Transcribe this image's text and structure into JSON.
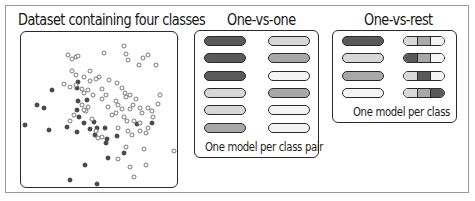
{
  "panels": {
    "dataset": {
      "title": "Dataset containing four classes"
    },
    "one_vs_one": {
      "title": "One-vs-one",
      "caption": "One model per class pair",
      "rows": [
        {
          "left": "#5a5a5a",
          "right": "#d8d8d8"
        },
        {
          "left": "#5a5a5a",
          "right": "#a8a8a8"
        },
        {
          "left": "#5a5a5a",
          "right": "#f4f4f4"
        },
        {
          "left": "#d8d8d8",
          "right": "#a8a8a8"
        },
        {
          "left": "#d8d8d8",
          "right": "#f4f4f4"
        },
        {
          "left": "#a8a8a8",
          "right": "#f4f4f4"
        }
      ]
    },
    "one_vs_rest": {
      "title": "One-vs-rest",
      "caption": "One model per class",
      "rows": [
        {
          "single": "#5a5a5a",
          "rest": [
            "#d8d8d8",
            "#a8a8a8",
            "#f4f4f4"
          ]
        },
        {
          "single": "#d8d8d8",
          "rest": [
            "#5a5a5a",
            "#a8a8a8",
            "#f4f4f4"
          ]
        },
        {
          "single": "#a8a8a8",
          "rest": [
            "#d8d8d8",
            "#5a5a5a",
            "#f4f4f4"
          ]
        },
        {
          "single": "#f4f4f4",
          "rest": [
            "#d8d8d8",
            "#a8a8a8",
            "#5a5a5a"
          ]
        }
      ]
    }
  },
  "colors": {
    "class_dark": "#5a5a5a",
    "class_light": "#d8d8d8",
    "class_mid": "#a8a8a8",
    "class_white": "#f4f4f4",
    "outline": "#2a2a2a"
  },
  "chart_data": {
    "type": "scatter",
    "title": "Dataset containing four classes",
    "xlabel": "",
    "ylabel": "",
    "grid": false,
    "legend": "none",
    "xlim": [
      0,
      158
    ],
    "ylim": [
      0,
      157
    ],
    "series": [
      {
        "name": "filled (dark)",
        "marker": "filled-circle",
        "points": [
          [
            30,
            55
          ],
          [
            15,
            70
          ],
          [
            22,
            73
          ],
          [
            3,
            90
          ],
          [
            45,
            92
          ],
          [
            27,
            95
          ],
          [
            55,
            53
          ],
          [
            56,
            66
          ],
          [
            55,
            75
          ],
          [
            57,
            82
          ],
          [
            62,
            88
          ],
          [
            55,
            97
          ],
          [
            68,
            94
          ],
          [
            75,
            93
          ],
          [
            83,
            93
          ],
          [
            73,
            100
          ],
          [
            84,
            108
          ],
          [
            85,
            104
          ],
          [
            95,
            101
          ],
          [
            115,
            89
          ],
          [
            102,
            118
          ],
          [
            86,
            123
          ],
          [
            63,
            130
          ],
          [
            48,
            145
          ],
          [
            75,
            149
          ],
          [
            130,
            88
          ],
          [
            56,
            47
          ],
          [
            65,
            65
          ],
          [
            72,
            87
          ]
        ]
      },
      {
        "name": "hollow (light)",
        "marker": "hollow-circle",
        "points": [
          [
            46,
            20
          ],
          [
            50,
            24
          ],
          [
            54,
            22
          ],
          [
            56,
            21
          ],
          [
            82,
            18
          ],
          [
            102,
            11
          ],
          [
            104,
            19
          ],
          [
            106,
            25
          ],
          [
            121,
            23
          ],
          [
            126,
            20
          ],
          [
            117,
            30
          ],
          [
            134,
            30
          ],
          [
            159,
            4
          ],
          [
            50,
            36
          ],
          [
            54,
            40
          ],
          [
            62,
            42
          ],
          [
            68,
            46
          ],
          [
            77,
            42
          ],
          [
            87,
            45
          ],
          [
            95,
            48
          ],
          [
            42,
            49
          ],
          [
            48,
            52
          ],
          [
            54,
            50
          ],
          [
            60,
            54
          ],
          [
            62,
            58
          ],
          [
            66,
            55
          ],
          [
            80,
            54
          ],
          [
            84,
            60
          ],
          [
            100,
            53
          ],
          [
            103,
            58
          ],
          [
            104,
            62
          ],
          [
            108,
            60
          ],
          [
            138,
            60
          ],
          [
            136,
            69
          ],
          [
            114,
            64
          ],
          [
            111,
            70
          ],
          [
            96,
            70
          ],
          [
            94,
            78
          ],
          [
            100,
            74
          ],
          [
            102,
            82
          ],
          [
            105,
            86
          ],
          [
            108,
            74
          ],
          [
            118,
            73
          ],
          [
            126,
            73
          ],
          [
            130,
            76
          ],
          [
            131,
            82
          ],
          [
            120,
            78
          ],
          [
            112,
            86
          ],
          [
            118,
            88
          ],
          [
            106,
            96
          ],
          [
            110,
            100
          ],
          [
            118,
            96
          ],
          [
            126,
            93
          ],
          [
            124,
            98
          ],
          [
            64,
            76
          ],
          [
            66,
            72
          ],
          [
            70,
            84
          ],
          [
            74,
            96
          ],
          [
            76,
            103
          ],
          [
            80,
            102
          ],
          [
            71,
            60
          ],
          [
            94,
            66
          ],
          [
            60,
            70
          ],
          [
            62,
            75
          ],
          [
            52,
            80
          ],
          [
            48,
            86
          ],
          [
            96,
            93
          ],
          [
            104,
            112
          ],
          [
            122,
            114
          ],
          [
            96,
            124
          ],
          [
            124,
            130
          ],
          [
            152,
            116
          ],
          [
            108,
            132
          ],
          [
            112,
            142
          ],
          [
            68,
            36
          ],
          [
            74,
            44
          ],
          [
            80,
            64
          ],
          [
            90,
            80
          ],
          [
            86,
            72
          ]
        ]
      }
    ]
  }
}
